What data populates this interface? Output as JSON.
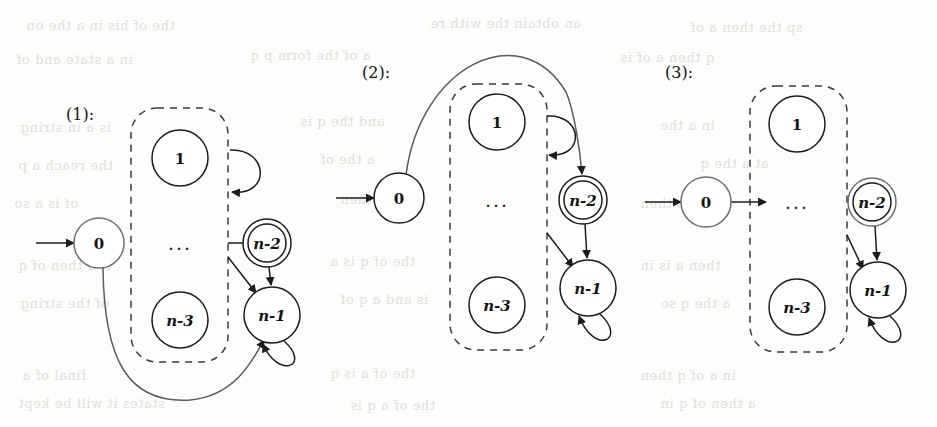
{
  "figure": {
    "background_color": "#fdfdfb",
    "ink_color": "#1c1c1c",
    "dashed_box_color": "#3a3a3a",
    "ghost_text_color": "#c9c7c0"
  },
  "diagrams": [
    {
      "caption": "(1):",
      "caption_pos": {
        "x": 66,
        "y": 114
      },
      "start_arrow": {
        "from_x": 36,
        "to_x": 74,
        "y": 243
      },
      "dashed_box": {
        "x": 131,
        "y": 108,
        "w": 97,
        "h": 254,
        "rx": 26
      },
      "nodes": [
        {
          "name": "node-0",
          "label": "0",
          "style": "plain",
          "cx": 99,
          "cy": 243,
          "r": 25,
          "accepting": false,
          "faint": true
        },
        {
          "name": "node-1",
          "label": "1",
          "style": "plain",
          "cx": 180,
          "cy": 158,
          "r": 28,
          "accepting": false,
          "faint": false
        },
        {
          "name": "node-n-3",
          "label": "n-3",
          "style": "ital",
          "cx": 180,
          "cy": 320,
          "r": 28,
          "accepting": false,
          "faint": false
        },
        {
          "name": "node-n-2",
          "label": "n-2",
          "style": "ital",
          "cx": 267,
          "cy": 243,
          "r": 24,
          "accepting": true,
          "faint": false
        },
        {
          "name": "node-n-1",
          "label": "n-1",
          "style": "ital",
          "cx": 272,
          "cy": 315,
          "r": 28,
          "accepting": false,
          "faint": false
        }
      ],
      "ellipsis": {
        "x": 180,
        "y": 243,
        "text": "..."
      },
      "edges": [
        {
          "name": "edge-box-to-n-2",
          "kind": "arrow-right",
          "d": "M 228 243 L 260 243"
        },
        {
          "name": "edge-loop-top",
          "kind": "self-loop",
          "d": "M 230 150 C 268 148 272 196 232 192"
        },
        {
          "name": "edge-n-2-to-n-1",
          "kind": "arrow-down",
          "d": "M 269 267 L 271 285"
        },
        {
          "name": "edge-box-to-n-1",
          "kind": "arrow-diag",
          "d": "M 228 257 L 256 293"
        },
        {
          "name": "edge-n-1-self-loop",
          "kind": "self-loop",
          "d": "M 284 341 C 312 366 278 380 263 344"
        },
        {
          "name": "edge-0-to-n-1-curve",
          "kind": "long-curve",
          "d": "M 103 268 C 104 360 128 404 190 400 C 234 396 252 362 264 340"
        }
      ]
    },
    {
      "caption": "(2):",
      "caption_pos": {
        "x": 362,
        "y": 72
      },
      "start_arrow": {
        "from_x": 336,
        "to_x": 374,
        "y": 198
      },
      "dashed_box": {
        "x": 450,
        "y": 84,
        "w": 97,
        "h": 266,
        "rx": 26
      },
      "nodes": [
        {
          "name": "node-0",
          "label": "0",
          "style": "plain",
          "cx": 399,
          "cy": 198,
          "r": 25,
          "accepting": false,
          "faint": false
        },
        {
          "name": "node-1",
          "label": "1",
          "style": "plain",
          "cx": 497,
          "cy": 122,
          "r": 28,
          "accepting": false,
          "faint": false
        },
        {
          "name": "node-n-3",
          "label": "n-3",
          "style": "ital",
          "cx": 497,
          "cy": 305,
          "r": 28,
          "accepting": false,
          "faint": false
        },
        {
          "name": "node-n-2",
          "label": "n-2",
          "style": "ital",
          "cx": 583,
          "cy": 200,
          "r": 24,
          "accepting": true,
          "faint": false
        },
        {
          "name": "node-n-1",
          "label": "n-1",
          "style": "ital",
          "cx": 588,
          "cy": 288,
          "r": 28,
          "accepting": false,
          "faint": false
        }
      ],
      "ellipsis": {
        "x": 497,
        "y": 200,
        "text": "..."
      },
      "edges": [
        {
          "name": "edge-0-to-n-2-arc",
          "kind": "long-arc",
          "d": "M 406 175 C 420 66 520 16 566 92 C 574 110 580 150 582 174"
        },
        {
          "name": "edge-loop-top",
          "kind": "self-loop",
          "d": "M 547 116 C 583 114 586 158 549 155"
        },
        {
          "name": "edge-n-2-to-n-1",
          "kind": "arrow-down",
          "d": "M 585 224 L 587 258"
        },
        {
          "name": "edge-box-to-n-1",
          "kind": "arrow-diag",
          "d": "M 547 233 L 573 267"
        },
        {
          "name": "edge-n-1-self-loop",
          "kind": "self-loop",
          "d": "M 600 314 C 628 340 594 356 579 316"
        }
      ]
    },
    {
      "caption": "(3):",
      "caption_pos": {
        "x": 665,
        "y": 72
      },
      "start_arrow": {
        "from_x": 645,
        "to_x": 681,
        "y": 202
      },
      "dashed_box": {
        "x": 750,
        "y": 86,
        "w": 97,
        "h": 266,
        "rx": 26
      },
      "nodes": [
        {
          "name": "node-0",
          "label": "0",
          "style": "plain",
          "cx": 706,
          "cy": 202,
          "r": 25,
          "accepting": false,
          "faint": true
        },
        {
          "name": "node-1",
          "label": "1",
          "style": "plain",
          "cx": 797,
          "cy": 124,
          "r": 28,
          "accepting": false,
          "faint": false
        },
        {
          "name": "node-n-3",
          "label": "n-3",
          "style": "ital",
          "cx": 797,
          "cy": 307,
          "r": 28,
          "accepting": false,
          "faint": false
        },
        {
          "name": "node-n-2",
          "label": "n-2",
          "style": "ital",
          "cx": 872,
          "cy": 202,
          "r": 24,
          "accepting": true,
          "faint": true
        },
        {
          "name": "node-n-1",
          "label": "n-1",
          "style": "ital",
          "cx": 878,
          "cy": 290,
          "r": 28,
          "accepting": false,
          "faint": false
        }
      ],
      "ellipsis": {
        "x": 797,
        "y": 202,
        "text": "..."
      },
      "edges": [
        {
          "name": "edge-0-to-box",
          "kind": "arrow-right",
          "d": "M 731 202 L 766 202"
        },
        {
          "name": "edge-box-to-n-2",
          "kind": "arrow-right",
          "d": "M 847 202 L 864 202"
        },
        {
          "name": "edge-n-2-to-n-1",
          "kind": "arrow-down",
          "d": "M 875 226 L 877 260"
        },
        {
          "name": "edge-box-to-n-1",
          "kind": "arrow-diag",
          "d": "M 847 235 L 863 269"
        },
        {
          "name": "edge-n-1-self-loop",
          "kind": "self-loop",
          "d": "M 890 316 C 918 342 884 358 869 318"
        }
      ]
    }
  ],
  "ghost_text": [
    {
      "text": "the of his in a the on",
      "x": 26,
      "y": 18
    },
    {
      "text": "an obtain the with re",
      "x": 430,
      "y": 16
    },
    {
      "text": "sp the then a of",
      "x": 690,
      "y": 20
    },
    {
      "text": "in a state and of",
      "x": 16,
      "y": 52
    },
    {
      "text": "a of the form p q",
      "x": 250,
      "y": 48
    },
    {
      "text": "q then a of is",
      "x": 620,
      "y": 50
    },
    {
      "text": "is a in string",
      "x": 20,
      "y": 120
    },
    {
      "text": "and the q is",
      "x": 300,
      "y": 114
    },
    {
      "text": "in a the",
      "x": 660,
      "y": 118
    },
    {
      "text": "the reach a p",
      "x": 18,
      "y": 158
    },
    {
      "text": "a the of",
      "x": 320,
      "y": 152
    },
    {
      "text": "at a the q",
      "x": 700,
      "y": 156
    },
    {
      "text": "of is a so",
      "x": 14,
      "y": 196
    },
    {
      "text": "q and then",
      "x": 340,
      "y": 192
    },
    {
      "text": "the is then",
      "x": 640,
      "y": 196
    },
    {
      "text": "if a then of q",
      "x": 18,
      "y": 258
    },
    {
      "text": "the of q is a",
      "x": 330,
      "y": 254
    },
    {
      "text": "then a is in",
      "x": 640,
      "y": 258
    },
    {
      "text": "of the string",
      "x": 20,
      "y": 296
    },
    {
      "text": "is and a q of",
      "x": 340,
      "y": 292
    },
    {
      "text": "a the q so",
      "x": 660,
      "y": 296
    },
    {
      "text": "final of a",
      "x": 22,
      "y": 368
    },
    {
      "text": "the of a is q",
      "x": 330,
      "y": 366
    },
    {
      "text": "in a of q then",
      "x": 640,
      "y": 368
    },
    {
      "text": "states it will be kept",
      "x": 18,
      "y": 396
    },
    {
      "text": "the of a q is",
      "x": 350,
      "y": 398
    },
    {
      "text": "a then of q in",
      "x": 660,
      "y": 396
    }
  ]
}
